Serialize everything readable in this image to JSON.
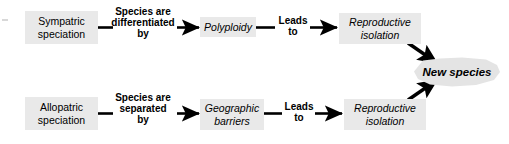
{
  "diagram": {
    "background_color": "#ffffff",
    "node_fill_color": "#e9e9e9",
    "line_color": "#000000",
    "nodes": [
      {
        "id": "sympatric",
        "label": "Sympatric\nspeciation",
        "style": "plain"
      },
      {
        "id": "polyploidy",
        "label": "Polyploidy",
        "style": "italic"
      },
      {
        "id": "repro_iso_top",
        "label": "Reproductive\nisolation",
        "style": "italic"
      },
      {
        "id": "allopatric",
        "label": "Allopatric\nspeciation",
        "style": "plain"
      },
      {
        "id": "geo_barriers",
        "label": "Geographic\nbarriers",
        "style": "italic"
      },
      {
        "id": "repro_iso_bot",
        "label": "Reproductive\nisolation",
        "style": "italic"
      }
    ],
    "edge_labels": [
      {
        "id": "differentiated_by",
        "text": "Species are\ndifferentiated\nby"
      },
      {
        "id": "leads_to_top",
        "text": "Leads\nto"
      },
      {
        "id": "separated_by",
        "text": "Species are\nseparated\nby"
      },
      {
        "id": "leads_to_bottom",
        "text": "Leads\nto"
      }
    ],
    "outcome": {
      "id": "new_species",
      "label": "New species",
      "shape": "burst",
      "fill_color": "#e4e4e4"
    }
  }
}
